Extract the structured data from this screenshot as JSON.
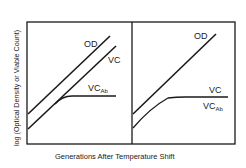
{
  "figure": {
    "y_axis_label": "log (Optical Density or Viable Count)",
    "x_axis_label": "Generations After Temperature Shift",
    "panels": [
      {
        "id": "left",
        "curves": [
          {
            "name": "OD",
            "label": "OD"
          },
          {
            "name": "VC",
            "label": "VC"
          },
          {
            "name": "VCAb",
            "label": "VC",
            "label_sub": "Ab"
          }
        ]
      },
      {
        "id": "right",
        "curves": [
          {
            "name": "OD",
            "label": "OD"
          },
          {
            "name": "VC",
            "label": "VC"
          },
          {
            "name": "VCAb",
            "label": "VC",
            "label_sub": "Ab"
          }
        ]
      }
    ],
    "colors": {
      "line": "#1a1a1a",
      "background": "#ffffff"
    }
  }
}
